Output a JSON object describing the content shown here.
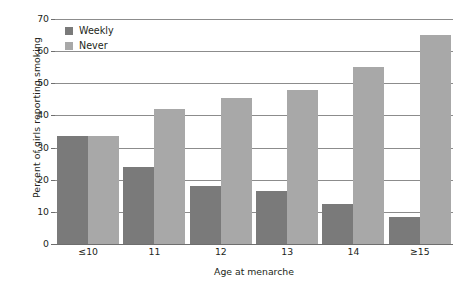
{
  "chart_data": {
    "type": "bar",
    "title": "",
    "xlabel": "Age at menarche",
    "ylabel": "Percent of girls reporting smoking",
    "categories": [
      "≤10",
      "11",
      "12",
      "13",
      "14",
      "≥15"
    ],
    "series": [
      {
        "name": "Weekly",
        "color": "#7a7a7a",
        "values": [
          33.5,
          24,
          18,
          16.5,
          12.5,
          8.5
        ]
      },
      {
        "name": "Never",
        "color": "#a8a8a8",
        "values": [
          33.5,
          42,
          45.5,
          48,
          55,
          65
        ]
      }
    ],
    "ylim": [
      0,
      70
    ],
    "yticks": [
      0,
      10,
      20,
      30,
      40,
      50,
      60,
      70
    ],
    "ytick_labels": [
      "0",
      "10",
      "20",
      "30",
      "40",
      "50",
      "60",
      "70"
    ],
    "grid": true,
    "legend_position": "top-left"
  }
}
